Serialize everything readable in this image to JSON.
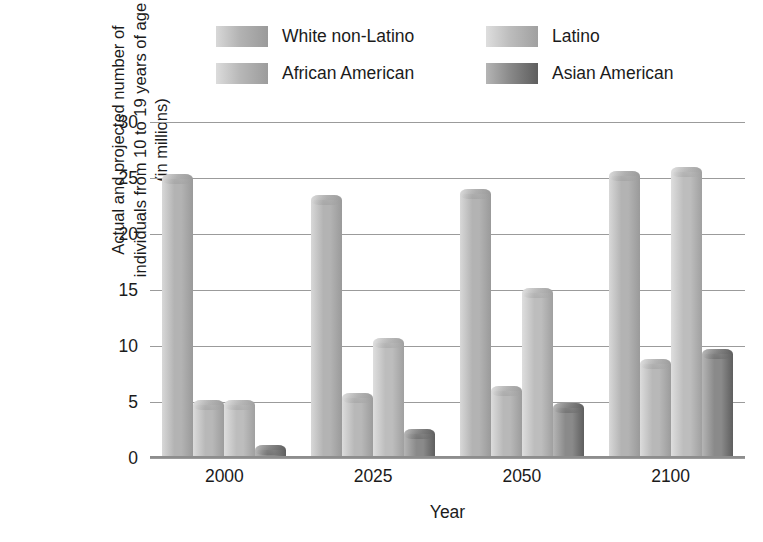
{
  "chart_data": {
    "type": "bar",
    "title": "",
    "xlabel": "Year",
    "ylabel": "Actual and projected number of individuals from 10 to 19 years of age (in millions)",
    "ylabel_lines": [
      "Actual and projected number of",
      "individuals from 10 to 19 years of age",
      "(in millions)"
    ],
    "categories": [
      "2000",
      "2025",
      "2050",
      "2100"
    ],
    "ylim": [
      0,
      30
    ],
    "yticks": [
      0,
      5,
      10,
      15,
      20,
      25,
      30
    ],
    "ytick_labels": [
      "0",
      "5",
      "10",
      "15",
      "20",
      "25",
      "30"
    ],
    "grid": true,
    "legend_position": "top",
    "series": [
      {
        "name": "White non-Latino",
        "color": "#b3b3b3",
        "color_light": "#d8d8d8",
        "color_dark": "#9a9a9a",
        "values": [
          25.4,
          23.5,
          24.0,
          25.6
        ]
      },
      {
        "name": "African American",
        "color": "#b8b8b8",
        "color_light": "#dcdcdc",
        "color_dark": "#9c9c9c",
        "values": [
          5.2,
          5.8,
          6.4,
          8.8
        ]
      },
      {
        "name": "Latino",
        "color": "#bdbdbd",
        "color_light": "#dedede",
        "color_dark": "#a0a0a0",
        "values": [
          5.2,
          10.7,
          15.2,
          26.0
        ]
      },
      {
        "name": "Asian American",
        "color": "#8a8a8a",
        "color_light": "#b5b5b5",
        "color_dark": "#5e5e5e",
        "values": [
          1.2,
          2.6,
          4.9,
          9.7
        ]
      }
    ]
  },
  "legend": {
    "entries": [
      {
        "label": "White non-Latino"
      },
      {
        "label": "Latino"
      },
      {
        "label": "African American"
      },
      {
        "label": "Asian American"
      }
    ]
  }
}
